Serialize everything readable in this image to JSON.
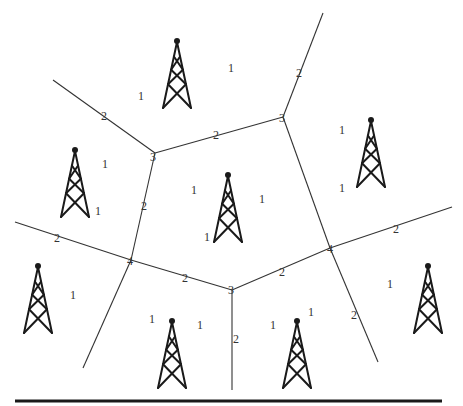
{
  "colors": {
    "line": "#333333",
    "tower": "#1a1a1a",
    "background": "#ffffff"
  },
  "towers": [
    {
      "id": "t1",
      "icon": "radio-tower-icon"
    },
    {
      "id": "t2",
      "icon": "radio-tower-icon"
    },
    {
      "id": "t3",
      "icon": "radio-tower-icon"
    },
    {
      "id": "t4",
      "icon": "radio-tower-icon"
    },
    {
      "id": "t5",
      "icon": "radio-tower-icon"
    },
    {
      "id": "t6",
      "icon": "radio-tower-icon"
    },
    {
      "id": "t7",
      "icon": "radio-tower-icon"
    },
    {
      "id": "t8",
      "icon": "radio-tower-icon"
    }
  ],
  "vertex_labels": [
    "3",
    "3",
    "4",
    "3",
    "4"
  ],
  "edge_labels": [
    "2",
    "2",
    "2",
    "2",
    "2",
    "2",
    "2",
    "2",
    "2",
    "2",
    "2"
  ],
  "cell_labels": [
    "1",
    "1",
    "1",
    "1",
    "1",
    "1",
    "1",
    "1",
    "1",
    "1",
    "1",
    "1",
    "1",
    "1",
    "1",
    "1"
  ]
}
